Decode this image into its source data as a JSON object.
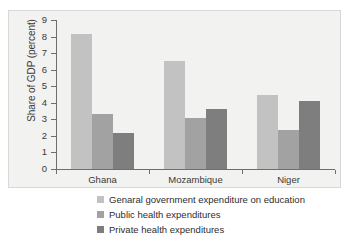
{
  "chart_data": {
    "type": "bar",
    "title": "",
    "subtitle": "",
    "xlabel": "",
    "ylabel": "Share of GDP (percent)",
    "categories": [
      "Ghana",
      "Mozambique",
      "Niger"
    ],
    "series": [
      {
        "name": "Genaral government expenditure on education",
        "color": "#c2c2c2",
        "values": [
          8.15,
          6.55,
          4.45
        ]
      },
      {
        "name": "Public health expenditures",
        "color": "#a2a2a2",
        "values": [
          3.3,
          3.1,
          2.35
        ]
      },
      {
        "name": "Private health expenditures",
        "color": "#7e7e7e",
        "values": [
          2.15,
          3.6,
          4.1
        ]
      }
    ],
    "ylim": [
      0,
      9
    ],
    "ytick_labels": [
      "9",
      "8",
      "7",
      "6",
      "5",
      "4",
      "3",
      "2",
      "1",
      "0"
    ],
    "ytick_values": [
      9,
      8,
      7,
      6,
      5,
      4,
      3,
      2,
      1,
      0
    ],
    "grid": false,
    "legend_position": "bottom",
    "plot_background": "#f2f2f0"
  },
  "legend": {
    "items": [
      {
        "label": "Genaral government expenditure on education",
        "color": "#c2c2c2"
      },
      {
        "label": "Public health expenditures",
        "color": "#a2a2a2"
      },
      {
        "label": "Private health expenditures",
        "color": "#7e7e7e"
      }
    ]
  }
}
